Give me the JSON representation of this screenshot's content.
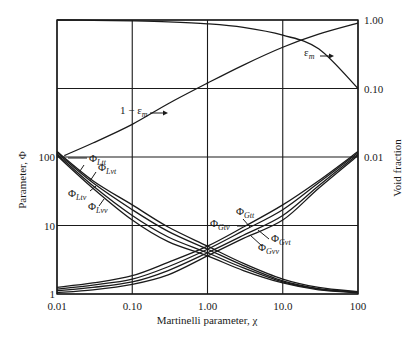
{
  "chart_data": {
    "type": "line",
    "title": "",
    "xlabel": "Martinelli parameter, χ",
    "ylabel": "Parameter, Φ",
    "y2label": "Void fraction",
    "xscale": "log",
    "yscale": "log",
    "xlim": [
      0.01,
      100
    ],
    "ylim": [
      1,
      10000
    ],
    "y2lim": [
      0.0001,
      1.0
    ],
    "grid": true,
    "x_ticks": [
      "0.01",
      "0.10",
      "1.00",
      "10.0",
      "100"
    ],
    "x_tick_values": [
      0.01,
      0.1,
      1,
      10,
      100
    ],
    "y_ticks": [
      "1",
      "10",
      "100"
    ],
    "y_tick_values": [
      1,
      10,
      100
    ],
    "y2_ticks": [
      "0.01",
      "0.10",
      "1.00"
    ],
    "y2_tick_values": [
      0.01,
      0.1,
      1.0
    ],
    "x": [
      0.01,
      0.03,
      0.1,
      0.3,
      1,
      3,
      10,
      30,
      100
    ],
    "series": [
      {
        "name": "Φ_Ltt",
        "axis": "left",
        "values": [
          120,
          45,
          20,
          9.5,
          5.0,
          2.8,
          1.65,
          1.25,
          1.08
        ]
      },
      {
        "name": "Φ_Lvt",
        "axis": "left",
        "values": [
          115,
          42,
          17,
          8.2,
          4.5,
          2.6,
          1.55,
          1.2,
          1.06
        ]
      },
      {
        "name": "Φ_Ltv",
        "axis": "left",
        "values": [
          110,
          38,
          14,
          6.8,
          4.0,
          2.4,
          1.5,
          1.18,
          1.05
        ]
      },
      {
        "name": "Φ_Lvv",
        "axis": "left",
        "values": [
          105,
          35,
          12,
          5.8,
          3.6,
          2.2,
          1.45,
          1.15,
          1.04
        ]
      },
      {
        "name": "Φ_Gtt",
        "axis": "left",
        "values": [
          1.25,
          1.45,
          1.85,
          2.9,
          5.0,
          9.5,
          20,
          45,
          120
        ]
      },
      {
        "name": "Φ_Gvt",
        "axis": "left",
        "values": [
          1.18,
          1.35,
          1.65,
          2.5,
          4.5,
          8.4,
          17,
          42,
          115
        ]
      },
      {
        "name": "Φ_Gtv",
        "axis": "left",
        "values": [
          1.12,
          1.25,
          1.5,
          2.2,
          4.0,
          7.2,
          14,
          38,
          110
        ]
      },
      {
        "name": "Φ_Gvv",
        "axis": "left",
        "values": [
          1.05,
          1.15,
          1.38,
          1.9,
          3.6,
          6.5,
          12,
          35,
          105
        ]
      },
      {
        "name": "ε_m",
        "axis": "right",
        "values": [
          1.0,
          0.99,
          0.97,
          0.94,
          0.88,
          0.78,
          0.6,
          0.38,
          0.1
        ]
      },
      {
        "name": "1 − ε_m",
        "axis": "right",
        "values": [
          0.01,
          0.016,
          0.03,
          0.06,
          0.12,
          0.22,
          0.4,
          0.62,
          0.9
        ]
      }
    ],
    "annotations": [
      {
        "text": "1 − ε_m →",
        "x": 0.1,
        "y2": 0.08
      },
      {
        "text": "ε_m →",
        "x": 20,
        "y2": 0.4
      }
    ],
    "legend": "inline labels"
  },
  "labels": {
    "x_axis_title": "Martinelli parameter, χ",
    "y_axis_title": "Parameter, Φ",
    "y2_axis_title": "Void fraction",
    "one_minus_em_main": "1 − ε",
    "one_minus_em_sub": "m",
    "em_main": "ε",
    "em_sub": "m",
    "phi": "Φ",
    "Ltt": "Ltt",
    "Lvt": "Lvt",
    "Ltv": "Ltv",
    "Lvv": "Lvv",
    "Gtt": "Gtt",
    "Gvt": "Gvt",
    "Gtv": "Gtv",
    "Gvv": "Gvv"
  },
  "colors": {
    "line": "#1a1a1a",
    "grid": "#1a1a1a",
    "background": "#ffffff"
  }
}
